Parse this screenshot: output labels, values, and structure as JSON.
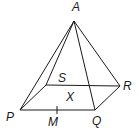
{
  "diagram": {
    "type": "square-based pyramid",
    "vertices": {
      "A": {
        "label": "A",
        "x": 74,
        "y": 21,
        "lx": 72,
        "ly": 11
      },
      "P": {
        "label": "P",
        "x": 20,
        "y": 110,
        "lx": 6,
        "ly": 121
      },
      "Q": {
        "label": "Q",
        "x": 95,
        "y": 110,
        "lx": 92,
        "ly": 125
      },
      "R": {
        "label": "R",
        "x": 120,
        "y": 86,
        "lx": 123,
        "ly": 90
      },
      "S": {
        "label": "S",
        "x": 46,
        "y": 85,
        "lx": 58,
        "ly": 82
      }
    },
    "points": {
      "X": {
        "label": "X",
        "lx": 66,
        "ly": 101
      },
      "M": {
        "label": "M",
        "x": 57,
        "y": 110,
        "lx": 48,
        "ly": 126
      }
    },
    "edges": [
      [
        "A",
        "P"
      ],
      [
        "A",
        "Q"
      ],
      [
        "A",
        "R"
      ],
      [
        "A",
        "S"
      ],
      [
        "P",
        "Q"
      ],
      [
        "Q",
        "R"
      ],
      [
        "R",
        "S"
      ],
      [
        "S",
        "P"
      ]
    ],
    "stroke_color": "#1a1a1a"
  }
}
